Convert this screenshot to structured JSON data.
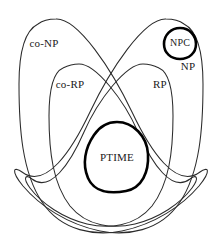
{
  "diagram": {
    "kind": "venn-euler-complexity-classes",
    "background_color": "#ffffff",
    "stroke_color": "#2b2b2b",
    "thick_stroke_color": "#000000",
    "label_color": "#1a1a1a",
    "labels": {
      "co_np": "co-NP",
      "co_rp": "co-RP",
      "rp": "RP",
      "np": "NP",
      "npc": "NPC",
      "ptime": "PTIME"
    },
    "regions": [
      {
        "id": "co-np",
        "label": "co-NP",
        "emphasis": "thin",
        "label_x": 44,
        "label_y": 44,
        "anchor": "middle"
      },
      {
        "id": "np",
        "label": "NP",
        "emphasis": "thin",
        "label_x": 188,
        "label_y": 67,
        "anchor": "middle"
      },
      {
        "id": "co-rp",
        "label": "co-RP",
        "emphasis": "thin",
        "label_x": 70,
        "label_y": 85,
        "anchor": "middle"
      },
      {
        "id": "rp",
        "label": "RP",
        "emphasis": "thin",
        "label_x": 160,
        "label_y": 85,
        "anchor": "middle"
      },
      {
        "id": "npc",
        "label": "NPC",
        "emphasis": "thick",
        "label_x": 180,
        "label_y": 44,
        "anchor": "middle"
      },
      {
        "id": "ptime",
        "label": "PTIME",
        "emphasis": "thick",
        "label_x": 117,
        "label_y": 158,
        "anchor": "middle"
      }
    ]
  }
}
